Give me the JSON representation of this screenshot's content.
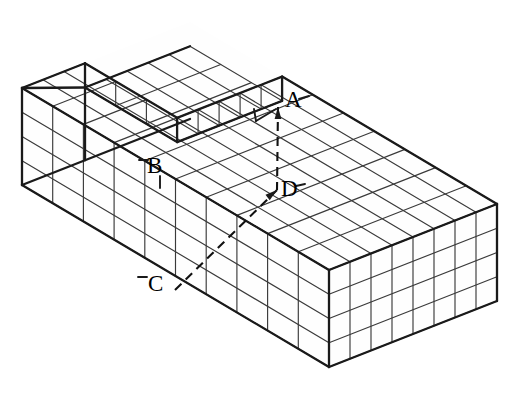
{
  "figure": {
    "kind": "isometric-unit-cube-block-with-notch",
    "background_color": "#ffffff",
    "line_color": "#1a1a1a",
    "grid_line_color": "#3a3a3a",
    "dashed_color": "#111111",
    "canvas": {
      "width": 513,
      "height": 404
    },
    "block": {
      "cells_long": 10,
      "cells_wide": 8,
      "cells_high": 4,
      "notch_cells_deep": 1
    },
    "projection": {
      "origin_x": 190,
      "origin_y": 22,
      "u_dx": 30.7,
      "u_dy": 18.2,
      "v_dx": -21.0,
      "v_dy": 8.25,
      "h_dy": 24.25
    },
    "labels": [
      {
        "id": "A",
        "text": "A",
        "x": 285,
        "y": 88
      },
      {
        "id": "B",
        "text": "B",
        "x": 147,
        "y": 154
      },
      {
        "id": "C",
        "text": "C",
        "x": 148,
        "y": 272
      },
      {
        "id": "D",
        "text": "D",
        "x": 281,
        "y": 177
      }
    ],
    "points": [
      {
        "id": "A",
        "x": 278,
        "y": 107
      },
      {
        "id": "B",
        "x": 175,
        "y": 186
      },
      {
        "id": "C",
        "x": 175,
        "y": 290
      },
      {
        "id": "D",
        "x": 277,
        "y": 190
      }
    ],
    "dashed_segments": [
      {
        "from": "A",
        "to": "D"
      },
      {
        "from": "C",
        "to": "D"
      }
    ],
    "leader_ticks": [
      {
        "for": "A",
        "x1": 299,
        "y1": 99,
        "x2": 309,
        "y2": 96
      },
      {
        "for": "B",
        "x1": 139,
        "y1": 160,
        "x2": 148,
        "y2": 160
      },
      {
        "for": "B",
        "x1": 160,
        "y1": 176,
        "x2": 160,
        "y2": 188
      },
      {
        "for": "C",
        "x1": 138,
        "y1": 277,
        "x2": 147,
        "y2": 277
      },
      {
        "for": "D",
        "x1": 296,
        "y1": 186,
        "x2": 305,
        "y2": 184
      }
    ]
  }
}
